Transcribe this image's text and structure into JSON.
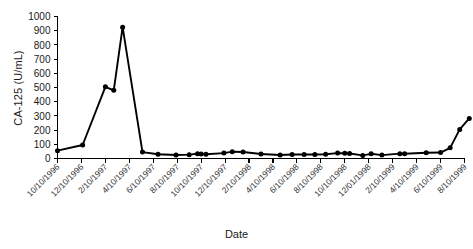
{
  "chart_data": {
    "type": "line",
    "title": "",
    "xlabel": "Date",
    "ylabel": "CA-125 (U/mL)",
    "ylim": [
      0,
      1000
    ],
    "ytick_step": 100,
    "yticks": [
      0,
      100,
      200,
      300,
      400,
      500,
      600,
      700,
      800,
      900,
      1000
    ],
    "grid": false,
    "legend": false,
    "marker": "filled-circle",
    "line_color": "#000000",
    "marker_color": "#000000",
    "xtick_labels": [
      "10/10/1996",
      "12/10/1996",
      "2/10/1997",
      "4/10/1997",
      "6/10/1997",
      "8/10/1997",
      "10/10/1997",
      "12/10/1997",
      "2/10/1998",
      "4/10/1998",
      "6/10/1998",
      "8/10/1998",
      "10/10/1998",
      "12/01/1998",
      "2/10/1999",
      "4/10/1999",
      "6/10/1999",
      "8/10/1999"
    ],
    "x": [
      0.0,
      1.05,
      2.0,
      2.35,
      2.72,
      3.55,
      4.2,
      4.95,
      5.5,
      5.85,
      6.0,
      6.2,
      6.95,
      7.3,
      7.75,
      8.5,
      9.3,
      9.8,
      10.3,
      10.75,
      11.2,
      11.7,
      12.0,
      12.2,
      12.75,
      13.1,
      13.55,
      14.3,
      14.5,
      15.4,
      16.0,
      16.4,
      16.8,
      17.2
    ],
    "values": [
      55,
      95,
      505,
      480,
      925,
      45,
      30,
      25,
      27,
      33,
      32,
      30,
      38,
      48,
      46,
      32,
      25,
      28,
      29,
      28,
      30,
      38,
      37,
      35,
      22,
      33,
      24,
      34,
      33,
      40,
      42,
      75,
      205,
      282
    ],
    "series_name": "CA-125",
    "peak_value": 925,
    "final_value": 282,
    "first_value": 55
  }
}
